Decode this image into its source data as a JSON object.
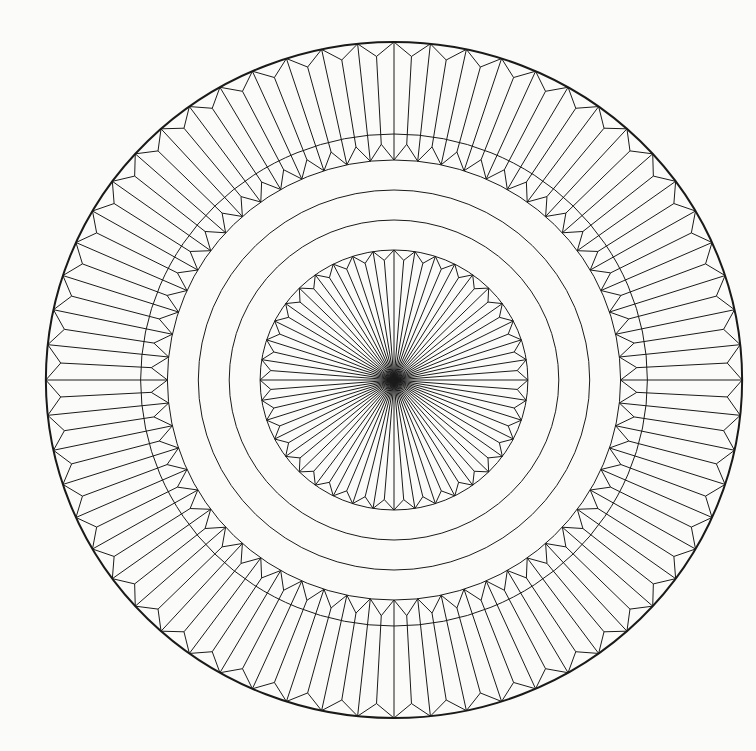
{
  "figure": {
    "background_color": "#fbfbf9",
    "stroke_color": "#1a1a1a",
    "center": {
      "x": 394,
      "y": 380
    },
    "scale_x": 1.03,
    "outer_circle": {
      "r": 338,
      "stroke_width": 2
    },
    "outer_band": {
      "segments": 60,
      "outer_zigzag": {
        "peak_r": 338,
        "valley_r": 324
      },
      "thin_circle_r": 246,
      "inner_zigzag": {
        "outward_r": 236,
        "inward_r": 220
      },
      "inner_circle_r": 220
    },
    "rings": [
      190,
      160
    ],
    "inner_disc": {
      "r": 130,
      "peaks": 40,
      "valley_r": 120,
      "rays_to_peaks": true,
      "rays_to_valleys": true
    }
  }
}
